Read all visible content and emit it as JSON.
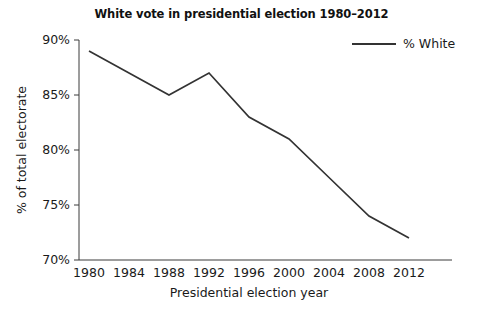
{
  "chart_data": {
    "type": "line",
    "title": "White vote in presidential election 1980–2012",
    "xlabel": "Presidential election year",
    "ylabel": "% of total electorate",
    "categories": [
      "1980",
      "1984",
      "1988",
      "1992",
      "1996",
      "2000",
      "2004",
      "2008",
      "2012"
    ],
    "x": [
      1980,
      1984,
      1988,
      1992,
      1996,
      2000,
      2004,
      2008,
      2012
    ],
    "series": [
      {
        "name": "% White",
        "values": [
          89,
          87,
          85,
          87,
          83,
          81,
          77.5,
          74,
          72
        ],
        "color": "#333333"
      }
    ],
    "xlim": [
      1980,
      2012
    ],
    "ylim": [
      70,
      90
    ],
    "ytick_labels": [
      "90%",
      "85%",
      "80%",
      "75%",
      "70%"
    ],
    "ytick_values": [
      90,
      85,
      80,
      75,
      70
    ],
    "xtick_labels": [
      "1980",
      "1984",
      "1988",
      "1992",
      "1996",
      "2000",
      "2004",
      "2008",
      "2012"
    ],
    "grid": false,
    "legend": {
      "position": "top-right",
      "entries": [
        "% White"
      ]
    }
  },
  "legend": {
    "label": "% White"
  }
}
